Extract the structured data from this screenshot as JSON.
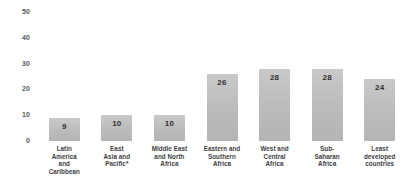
{
  "chart_data": {
    "type": "bar",
    "title": "",
    "subtitle": "",
    "xlabel": "",
    "ylabel": "",
    "ylim": [
      0,
      50
    ],
    "yticks": [
      0,
      10,
      20,
      30,
      40,
      50
    ],
    "ytick_labels": [
      "0",
      "10",
      "20",
      "30",
      "40",
      "50"
    ],
    "grid": false,
    "legend": false,
    "legend_position": "none",
    "categories": [
      "Latin\nAmerica\nand\nCaribbean",
      "East\nAsia and\nPacific*",
      "Middle East\nand North\nAfrica",
      "Eastern and\nSouthern\nAfrica",
      "West and\nCentral\nAfrica",
      "Sub-\nSaharan\nAfrica",
      "Least\ndeveloped\ncountries"
    ],
    "values": [
      9,
      10,
      10,
      26,
      28,
      28,
      24
    ],
    "value_labels": [
      "9",
      "10",
      "10",
      "26",
      "28",
      "28",
      "24"
    ],
    "bar_color": "#bdbdbd",
    "value_label_color": "#2f2f2f",
    "axis_label_color": "#58585a",
    "category_label_color": "#3d3d3f",
    "background_color": "#ffffff"
  }
}
